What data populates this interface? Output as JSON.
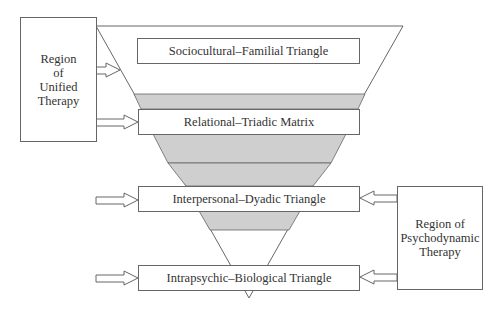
{
  "diagram": {
    "left_region": {
      "label_lines": [
        "Region",
        "of",
        "Unified",
        "Therapy"
      ]
    },
    "right_region": {
      "label_lines": [
        "Region of",
        "Psychodynamic",
        "Therapy"
      ]
    },
    "levels": [
      {
        "label": "Sociocultural–Familial Triangle"
      },
      {
        "label": "Relational–Triadic Matrix"
      },
      {
        "label": "Interpersonal–Dyadic Triangle"
      },
      {
        "label": "Intrapsychic–Biological Triangle"
      }
    ],
    "colors": {
      "shade": "#cfcfcf",
      "stroke": "#666666",
      "background": "#ffffff"
    }
  }
}
